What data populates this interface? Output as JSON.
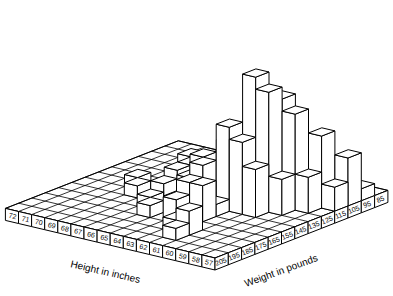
{
  "chart_data": {
    "type": "bar3d",
    "title": "",
    "xlabel": "Height in inches",
    "ylabel": "Weight in pounds",
    "height_ticks": [
      "72",
      "71",
      "70",
      "69",
      "68",
      "67",
      "66",
      "65",
      "64",
      "63",
      "62",
      "61",
      "60",
      "59",
      "58",
      "57"
    ],
    "weight_ticks": [
      "205",
      "195",
      "185",
      "175",
      "165",
      "155",
      "145",
      "135",
      "125",
      "115",
      "105",
      "95",
      "85"
    ],
    "bars": [
      {
        "h": "69",
        "w": "105",
        "v": 1
      },
      {
        "h": "68",
        "w": "115",
        "v": 1
      },
      {
        "h": "68",
        "w": "125",
        "v": 1
      },
      {
        "h": "67",
        "w": "105",
        "v": 1
      },
      {
        "h": "66",
        "w": "115",
        "v": 1
      },
      {
        "h": "65",
        "w": "125",
        "v": 1
      },
      {
        "h": "64",
        "w": "135",
        "v": 1
      },
      {
        "h": "63",
        "w": "145",
        "v": 1
      },
      {
        "h": "62",
        "w": "155",
        "v": 1
      },
      {
        "h": "69",
        "w": "145",
        "v": 1
      },
      {
        "h": "68",
        "w": "155",
        "v": 1
      },
      {
        "h": "67",
        "w": "145",
        "v": 1
      },
      {
        "h": "66",
        "w": "165",
        "v": 1
      },
      {
        "h": "65",
        "w": "175",
        "v": 1
      },
      {
        "h": "64",
        "w": "155",
        "v": 2
      },
      {
        "h": "63",
        "w": "165",
        "v": 3
      },
      {
        "h": "63",
        "w": "175",
        "v": 2
      },
      {
        "h": "62",
        "w": "185",
        "v": 1
      },
      {
        "h": "62",
        "w": "165",
        "v": 3
      },
      {
        "h": "61",
        "w": "195",
        "v": 1
      },
      {
        "h": "61",
        "w": "185",
        "v": 2
      },
      {
        "h": "66",
        "w": "135",
        "v": 1
      },
      {
        "h": "65",
        "w": "145",
        "v": 2
      },
      {
        "h": "64",
        "w": "145",
        "v": 4
      },
      {
        "h": "63",
        "w": "135",
        "v": 5
      },
      {
        "h": "63",
        "w": "155",
        "v": 4
      },
      {
        "h": "62",
        "w": "145",
        "v": 7
      },
      {
        "h": "62",
        "w": "135",
        "v": 6
      },
      {
        "h": "61",
        "w": "135",
        "v": 11
      },
      {
        "h": "61",
        "w": "145",
        "v": 6
      },
      {
        "h": "61",
        "w": "125",
        "v": 5
      },
      {
        "h": "60",
        "w": "135",
        "v": 10
      },
      {
        "h": "60",
        "w": "125",
        "v": 9
      },
      {
        "h": "60",
        "w": "145",
        "v": 4
      },
      {
        "h": "59",
        "w": "125",
        "v": 8
      },
      {
        "h": "59",
        "w": "115",
        "v": 5
      },
      {
        "h": "59",
        "w": "135",
        "v": 3
      },
      {
        "h": "58",
        "w": "115",
        "v": 6
      },
      {
        "h": "58",
        "w": "105",
        "v": 2
      },
      {
        "h": "58",
        "w": "125",
        "v": 3
      },
      {
        "h": "57",
        "w": "105",
        "v": 4
      },
      {
        "h": "57",
        "w": "95",
        "v": 1
      },
      {
        "h": "57",
        "w": "115",
        "v": 2
      },
      {
        "h": "60",
        "w": "115",
        "v": 2
      },
      {
        "h": "59",
        "w": "105",
        "v": 1
      }
    ],
    "grid": true,
    "legend": "none"
  }
}
